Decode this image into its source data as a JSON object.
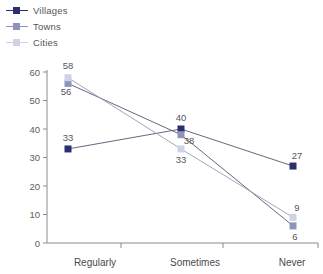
{
  "chart_data": {
    "type": "line",
    "title": "",
    "subtitle": "",
    "xlabel": "",
    "ylabel": "",
    "categories": [
      "Regularly",
      "Sometimes",
      "Never"
    ],
    "ylim": [
      0,
      60
    ],
    "yticks": [
      0,
      10,
      20,
      30,
      40,
      50,
      60
    ],
    "grid": false,
    "legend_position": "top-left",
    "series": [
      {
        "name": "Villages",
        "color": "#2b2f6e",
        "marker": "square",
        "values": [
          33,
          40,
          27
        ],
        "labels": [
          "33",
          "40",
          "27"
        ]
      },
      {
        "name": "Towns",
        "color": "#8e93bc",
        "marker": "square",
        "values": [
          56,
          38,
          6
        ],
        "labels": [
          "56",
          "38",
          "6"
        ]
      },
      {
        "name": "Cities",
        "color": "#cdd2e6",
        "marker": "square",
        "values": [
          58,
          33,
          9
        ],
        "labels": [
          "58",
          "33",
          "9"
        ]
      }
    ]
  },
  "legend": {
    "items": [
      {
        "label": "Villages",
        "color": "#2b2f6e"
      },
      {
        "label": "Towns",
        "color": "#8e93bc"
      },
      {
        "label": "Cities",
        "color": "#cdd2e6"
      }
    ]
  },
  "axes": {
    "y_tick_labels": [
      "60",
      "50",
      "40",
      "30",
      "20",
      "10",
      "0"
    ],
    "x_tick_labels": [
      "Regularly",
      "Sometimes",
      "Never"
    ],
    "axis_color": "#8a8a8a"
  }
}
